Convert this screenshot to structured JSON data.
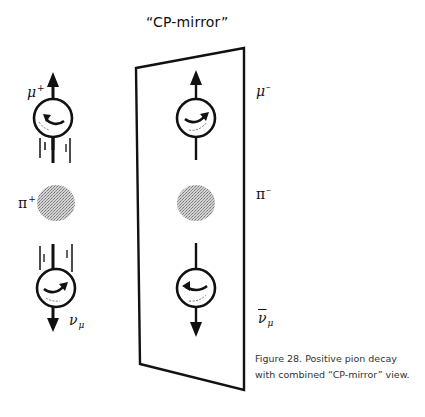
{
  "diagram": {
    "mirror_title": "“CP-mirror”",
    "left_side": {
      "muon_label": "μ",
      "muon_charge": "+",
      "pion_label": "π",
      "pion_charge": "+",
      "neutrino_label": "ν",
      "neutrino_sub": "μ"
    },
    "mirror_side": {
      "muon_label": "μ",
      "muon_charge": "–",
      "pion_label": "π",
      "pion_charge": "–",
      "antineutrino_label": "ν",
      "antineutrino_sub": "μ"
    },
    "caption": "Figure 28. Positive pion decay with combined “CP-mirror” view.",
    "colors": {
      "ink": "#111111",
      "pion_fill": "#a8a8a8",
      "caption_text": "#333333"
    }
  }
}
